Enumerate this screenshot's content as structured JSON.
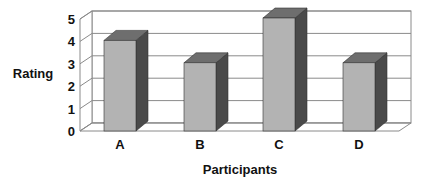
{
  "chart_data": {
    "type": "bar",
    "style": "3d-column",
    "title": "",
    "xlabel": "Participants",
    "ylabel": "Rating",
    "categories": [
      "A",
      "B",
      "C",
      "D"
    ],
    "values": [
      4,
      3,
      5,
      3
    ],
    "ylim": [
      0,
      5
    ],
    "yticks": [
      "0",
      "1",
      "2",
      "3",
      "4",
      "5"
    ],
    "grid": true,
    "legend": null,
    "colors": {
      "bar_front": "#b3b3b3",
      "bar_top": "#6e6e6e",
      "bar_side": "#4a4a4a",
      "grid": "#8a8a8a",
      "text": "#111111"
    }
  }
}
